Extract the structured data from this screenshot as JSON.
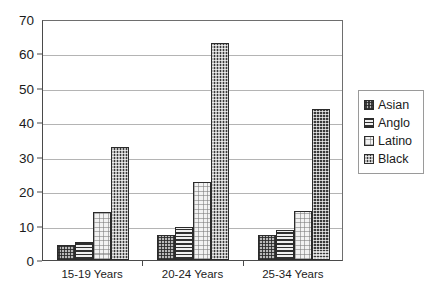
{
  "chart_data": {
    "type": "bar",
    "title": "",
    "xlabel": "",
    "ylabel": "",
    "categories": [
      "15-19 Years",
      "20-24 Years",
      "25-34 Years"
    ],
    "series": [
      {
        "name": "Asian",
        "values": [
          4.5,
          7.3,
          7.3
        ]
      },
      {
        "name": "Anglo",
        "values": [
          5.2,
          9.7,
          8.8
        ]
      },
      {
        "name": "Latino",
        "values": [
          14.0,
          22.7,
          14.3
        ]
      },
      {
        "name": "Black",
        "values": [
          32.8,
          63.0,
          44.0
        ]
      }
    ],
    "ylim": [
      0,
      70
    ],
    "ytick_values": [
      0,
      10,
      20,
      30,
      40,
      50,
      60,
      70
    ],
    "ytick_labels": [
      "0",
      "10",
      "20",
      "30",
      "40",
      "50",
      "60",
      "70"
    ],
    "grid": true,
    "legend_position": "right",
    "legend_entries": [
      "Asian",
      "Anglo",
      "Latino",
      "Black"
    ],
    "patterns": {
      "Asian": "checkered-gray",
      "Anglo": "horizontal-stripes",
      "Latino": "light-dots",
      "Black": "dark-checkerboard"
    },
    "colors": {
      "Asian": "#b9b9b9",
      "Anglo": "#e8e8e8",
      "Latino": "#f2f2f2",
      "Black": "#3a3a3a",
      "axis": "#4a4a4a",
      "gridline": "#b4b4b4",
      "background": "#ffffff"
    }
  }
}
